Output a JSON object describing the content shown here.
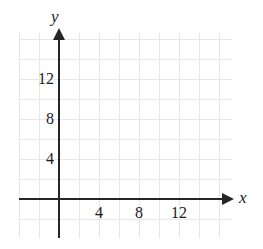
{
  "figure": {
    "axis_labels": {
      "x": "x",
      "y": "y"
    },
    "colors": {
      "grid": "#e7e7e7",
      "axis": "#262626",
      "text": "#1a1a1a",
      "background": "#ffffff"
    }
  },
  "chart_data": {
    "type": "line",
    "title": "",
    "subtitle": "",
    "xlabel": "x",
    "ylabel": "y",
    "xlim": [
      -8,
      34
    ],
    "ylim": [
      -8,
      33
    ],
    "grid": true,
    "legend": null,
    "series": [],
    "annotations": [],
    "xticks": [
      4,
      8,
      12
    ],
    "xtick_labels": [
      "4",
      "8",
      "12"
    ],
    "yticks": [
      4,
      8,
      12
    ],
    "ytick_labels": [
      "4",
      "8",
      "12"
    ],
    "grid_step": 2,
    "grid_columns": 11,
    "grid_rows": 10
  }
}
